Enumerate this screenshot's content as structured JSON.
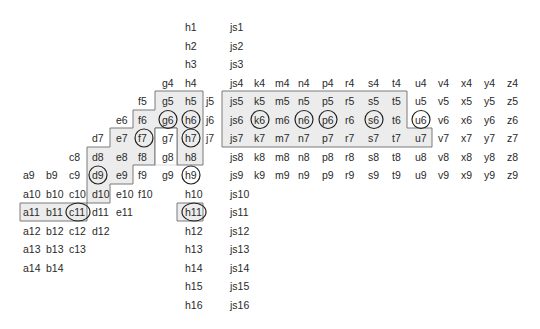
{
  "diagram": {
    "type": "grid-label-map",
    "colors": {
      "background": "#ffffff",
      "region_fill": "#ececec",
      "region_stroke": "#7a7a7a",
      "text": "#2a2a2a",
      "ring": "#222222"
    },
    "columns": {
      "a": 23,
      "b": 46,
      "c": 69,
      "d": 92,
      "e": 116,
      "f": 138,
      "g": 162,
      "h": 185,
      "j": 206,
      "js": 230,
      "k": 254,
      "m": 275,
      "n": 298,
      "p": 322,
      "r": 345,
      "s": 368,
      "t": 392,
      "u": 415,
      "v": 438,
      "x": 461,
      "y": 484,
      "z": 507
    },
    "row_spacing": 18.5,
    "first_row_y": 27,
    "cells": {
      "a": [
        9,
        10,
        11,
        12,
        13,
        14
      ],
      "b": [
        9,
        10,
        11,
        12,
        13,
        14
      ],
      "c": [
        8,
        9,
        10,
        11,
        12,
        13
      ],
      "d": [
        7,
        8,
        9,
        10,
        11,
        12
      ],
      "e": [
        6,
        7,
        8,
        9,
        10,
        11
      ],
      "f": [
        5,
        6,
        7,
        8,
        9,
        10
      ],
      "g": [
        4,
        5,
        6,
        7,
        8,
        9
      ],
      "h": [
        1,
        2,
        3,
        4,
        5,
        6,
        7,
        8,
        9,
        10,
        11,
        12,
        13,
        14,
        15,
        16
      ],
      "j": [
        5,
        6,
        7
      ],
      "js": [
        1,
        2,
        3,
        4,
        5,
        6,
        7,
        8,
        9,
        10,
        11,
        12,
        13,
        14,
        15,
        16
      ],
      "k": [
        4,
        5,
        6,
        7,
        8,
        9
      ],
      "m": [
        4,
        5,
        6,
        7,
        8,
        9
      ],
      "n": [
        4,
        5,
        6,
        7,
        8,
        9
      ],
      "p": [
        4,
        5,
        6,
        7,
        8,
        9
      ],
      "r": [
        4,
        5,
        6,
        7,
        8,
        9
      ],
      "s": [
        4,
        5,
        6,
        7,
        8,
        9
      ],
      "t": [
        4,
        5,
        6,
        7,
        8,
        9
      ],
      "u": [
        4,
        5,
        6,
        7,
        8,
        9
      ],
      "v": [
        4,
        5,
        6,
        7,
        8,
        9
      ],
      "x": [
        4,
        5,
        6,
        7,
        8,
        9
      ],
      "y": [
        4,
        5,
        6,
        7,
        8,
        9
      ],
      "z": [
        4,
        5,
        6,
        7,
        8,
        9
      ]
    },
    "circled": [
      "g6",
      "h6",
      "f7",
      "h7",
      "d9",
      "h9",
      "c11",
      "h11",
      "k6",
      "n6",
      "p6",
      "s6",
      "u6"
    ],
    "regions": [
      {
        "name": "left-staircase-region",
        "members": [
          "g5",
          "h5",
          "f6",
          "g6",
          "h6",
          "e7",
          "f7",
          "h7",
          "d8",
          "e8",
          "f8",
          "h8",
          "d9",
          "e9",
          "h9",
          "d10"
        ],
        "points": "155,91 203,91 203,165 177,165 177,128 155,128 155,165 133,165 133,184 110,184 110,203 87,203 87,147 110,147 110,128 133,128 133,110 155,110"
      },
      {
        "name": "notch-g7-g9",
        "members": [
          "g7",
          "g8",
          "g9"
        ],
        "points": "155,128 177,128 177,165 155,165"
      },
      {
        "name": "box-a11-c11",
        "members": [
          "a11",
          "b11",
          "c11"
        ],
        "points": "20,203 87,203 87,221 20,221"
      },
      {
        "name": "box-h11",
        "members": [
          "h11"
        ],
        "points": "177,203 203,203 203,221 177,221"
      },
      {
        "name": "right-region-js5-u7",
        "members": [
          "js5",
          "k5",
          "m5",
          "n5",
          "p5",
          "r5",
          "s5",
          "t5",
          "js6",
          "k6",
          "m6",
          "n6",
          "p6",
          "r6",
          "s6",
          "t6",
          "js7",
          "k7",
          "m7",
          "n7",
          "p7",
          "r7",
          "s7",
          "t7",
          "u7"
        ],
        "points": "222,91 407,91 407,128 432,128 432,147 222,147"
      }
    ]
  }
}
